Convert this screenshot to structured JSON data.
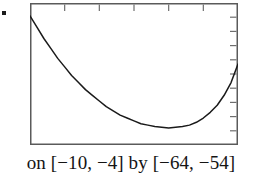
{
  "figure": {
    "name": "graphing-calculator-parabola",
    "caption": "on [−10, −4] by [−64, −54]",
    "bullet_marker": "▪"
  },
  "colors": {
    "frame": "#5a5a5a",
    "curve": "#1a1a1a",
    "tick": "#6e6e6e",
    "background": "#ffffff",
    "caption_text": "#141414"
  },
  "chart_data": {
    "type": "line",
    "title": "",
    "subtitle": "",
    "xlabel": "",
    "ylabel": "",
    "xlim": [
      -10,
      -4
    ],
    "ylim": [
      -64,
      -54
    ],
    "grid": false,
    "legend": "none",
    "x_window_label": "[−10, −4]",
    "y_window_label": "[−64, −54]",
    "x_tick_count": 6,
    "y_tick_count": 10,
    "x_tick_values": [
      -9,
      -8,
      -7,
      -6,
      -5,
      -4
    ],
    "y_tick_values": [
      -63,
      -62,
      -61,
      -60,
      -59,
      -58,
      -57,
      -56,
      -55,
      -54
    ],
    "x_ticks_position": "top",
    "y_ticks_position": "right",
    "series": [
      {
        "name": "parabola",
        "x": [
          -10.0,
          -9.8,
          -9.6,
          -9.4,
          -9.2,
          -9.0,
          -8.8,
          -8.6,
          -8.4,
          -8.2,
          -8.0,
          -7.8,
          -7.6,
          -7.4,
          -7.2,
          -7.0,
          -6.8,
          -6.6,
          -6.4,
          -6.2,
          -6.0,
          -5.8,
          -5.6,
          -5.4,
          -5.2,
          -5.0,
          -4.8,
          -4.6,
          -4.4,
          -4.2,
          -4.0
        ],
        "y": [
          -54.9,
          -55.7,
          -56.5,
          -57.2,
          -57.9,
          -58.5,
          -59.1,
          -59.6,
          -60.1,
          -60.5,
          -60.9,
          -61.3,
          -61.6,
          -61.9,
          -62.1,
          -62.3,
          -62.5,
          -62.6,
          -62.7,
          -62.75,
          -62.8,
          -62.75,
          -62.7,
          -62.6,
          -62.4,
          -62.1,
          -61.7,
          -61.2,
          -60.5,
          -59.6,
          -58.3
        ],
        "vertex": [
          -6.0,
          -62.8
        ],
        "note": "upward-opening parabola, minimum near the bottom of the window"
      }
    ]
  }
}
